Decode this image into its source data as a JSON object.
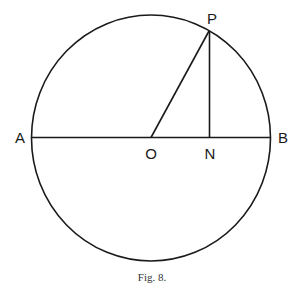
{
  "figure": {
    "caption": "Fig. 8.",
    "points": {
      "A": {
        "label": "A"
      },
      "B": {
        "label": "B"
      },
      "O": {
        "label": "O"
      },
      "N": {
        "label": "N"
      },
      "P": {
        "label": "P"
      }
    },
    "elements": [
      {
        "type": "circle",
        "center": "O",
        "description": "circle with centre O"
      },
      {
        "type": "segment",
        "from": "A",
        "to": "B",
        "description": "diameter AB through O"
      },
      {
        "type": "segment",
        "from": "O",
        "to": "P",
        "description": "radius OP"
      },
      {
        "type": "segment",
        "from": "P",
        "to": "N",
        "description": "perpendicular PN from P to AB"
      }
    ]
  }
}
